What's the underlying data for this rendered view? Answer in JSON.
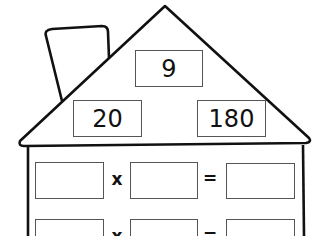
{
  "fact_family": {
    "top": "9",
    "left": "20",
    "right": "180"
  },
  "equations": [
    {
      "a": "",
      "op": "x",
      "b": "",
      "eq": "=",
      "c": ""
    },
    {
      "a": "",
      "op": "x",
      "b": "",
      "eq": "=",
      "c": ""
    }
  ],
  "colors": {
    "line": "#111111",
    "box_border": "#555555",
    "background": "#ffffff"
  }
}
